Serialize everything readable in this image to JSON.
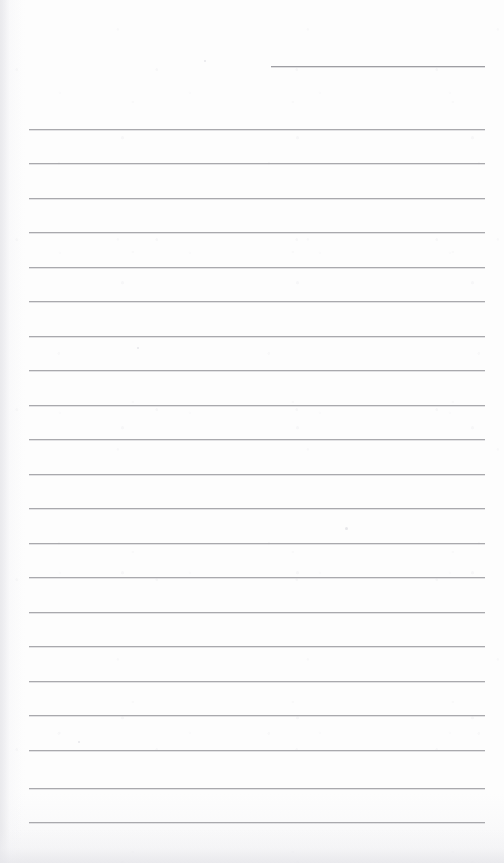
{
  "document": {
    "kind": "scanned-ruled-notepad-page",
    "title": "Blank Ruled Notepad Page",
    "width": 504,
    "height": 863,
    "background_color": "#fdfdfd",
    "has_visible_text": false,
    "written_content": "",
    "notes_text": ""
  },
  "ruling": {
    "line_color": "#a9a9ad",
    "header_line_color": "#9e9ea3",
    "line_thickness_px": 1,
    "line_spacing_px": 34.65,
    "body_line_count": 21,
    "body_left_x": 29,
    "body_right_x": 485,
    "body_first_y": 129,
    "body_last_y": 822
  },
  "header_rule": {
    "label": "header-date-rule",
    "x": 271,
    "y": 66,
    "width": 214
  },
  "body_rules": [
    {
      "y": 129
    },
    {
      "y": 163
    },
    {
      "y": 198
    },
    {
      "y": 232
    },
    {
      "y": 267
    },
    {
      "y": 301
    },
    {
      "y": 336
    },
    {
      "y": 370
    },
    {
      "y": 405
    },
    {
      "y": 439
    },
    {
      "y": 474
    },
    {
      "y": 508
    },
    {
      "y": 543
    },
    {
      "y": 577
    },
    {
      "y": 612
    },
    {
      "y": 646
    },
    {
      "y": 681
    },
    {
      "y": 715
    },
    {
      "y": 750
    },
    {
      "y": 788
    },
    {
      "y": 822
    }
  ],
  "artifacts": {
    "specks": [
      {
        "x": 345,
        "y": 527,
        "size": 3
      },
      {
        "x": 137,
        "y": 347,
        "size": 2
      },
      {
        "x": 78,
        "y": 741,
        "size": 2
      },
      {
        "x": 204,
        "y": 60,
        "size": 2
      }
    ]
  }
}
